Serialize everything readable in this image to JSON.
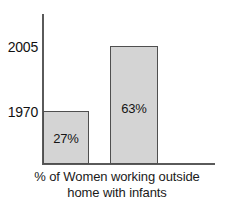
{
  "chart_data": {
    "type": "bar",
    "title": "",
    "subtitle": "",
    "xlabel": "% of Women working outside home with infants",
    "ylabel": "",
    "categories": [
      "1970",
      "2005"
    ],
    "values": [
      27,
      63
    ],
    "value_labels": [
      "27%",
      "63%"
    ],
    "tick_labels": [
      "2005",
      "1970"
    ],
    "ylim": [
      0,
      75
    ],
    "grid": false,
    "legend": "none",
    "orientation": "vertical",
    "colors": {
      "bar_fill": "#d4d4d4",
      "bar_border": "#4f4f4f",
      "axis": "#5a5a5a",
      "text": "#111111",
      "background": "#ffffff"
    }
  },
  "axis": {
    "ticks": [
      {
        "label": "2005",
        "value": 63
      },
      {
        "label": "1970",
        "value": 27
      }
    ]
  },
  "bars": [
    {
      "category": "1970",
      "value": 27,
      "label": "27%"
    },
    {
      "category": "2005",
      "value": 63,
      "label": "63%"
    }
  ],
  "caption": {
    "line1": "% of Women working outside",
    "line2": "home with infants"
  }
}
